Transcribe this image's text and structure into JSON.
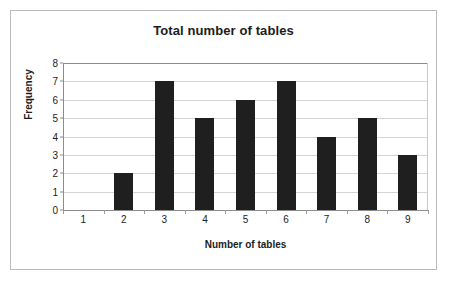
{
  "chart_data": {
    "type": "bar",
    "title": "Total number of tables",
    "xlabel": "Number of tables",
    "ylabel": "Frequency",
    "categories": [
      "1",
      "2",
      "3",
      "4",
      "5",
      "6",
      "7",
      "8",
      "9"
    ],
    "values": [
      0,
      2,
      7,
      5,
      6,
      7,
      4,
      5,
      3
    ],
    "ylim": [
      0,
      8
    ],
    "yticks": [
      "0",
      "1",
      "2",
      "3",
      "4",
      "5",
      "6",
      "7",
      "8"
    ],
    "grid": true,
    "legend": false,
    "bar_color": "#1f1f1f",
    "gridline_color": "#d4d4d4",
    "axis_color": "#8c8c8c",
    "border_color": "#b9b9b9",
    "background_color": "#ffffff"
  }
}
